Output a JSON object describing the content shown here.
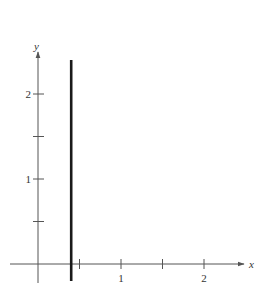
{
  "chart_data": {
    "type": "line",
    "title": "",
    "xlabel": "x",
    "ylabel": "y",
    "xlim": [
      -0.1,
      2.5
    ],
    "ylim": [
      -0.2,
      2.5
    ],
    "grid": false,
    "x_ticks": [
      0.5,
      1,
      1.5,
      2
    ],
    "x_tick_labels": [
      "",
      "1",
      "",
      "2"
    ],
    "y_ticks": [
      0.5,
      1,
      1.5,
      2
    ],
    "y_tick_labels": [
      "",
      "1",
      "",
      "2"
    ],
    "series": [
      {
        "name": "x = 0.4",
        "description": "vertical line",
        "x": [
          0.4,
          0.4
        ],
        "y": [
          -0.2,
          2.4
        ],
        "color": "#1a1a1a"
      }
    ],
    "legend": "none"
  }
}
